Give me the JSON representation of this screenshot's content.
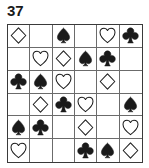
{
  "puzzle": {
    "number_label": "37",
    "grid": {
      "rows": 6,
      "columns": 6,
      "cells": [
        [
          {
            "suit": "diamond",
            "fill": "outline",
            "glyph": "♢"
          },
          {
            "suit": "empty",
            "fill": "none",
            "glyph": ""
          },
          {
            "suit": "spade",
            "fill": "filled",
            "glyph": "♠"
          },
          {
            "suit": "empty",
            "fill": "none",
            "glyph": ""
          },
          {
            "suit": "heart",
            "fill": "outline",
            "glyph": "♡"
          },
          {
            "suit": "club",
            "fill": "filled",
            "glyph": "♣"
          }
        ],
        [
          {
            "suit": "empty",
            "fill": "none",
            "glyph": ""
          },
          {
            "suit": "heart",
            "fill": "outline",
            "glyph": "♡"
          },
          {
            "suit": "diamond",
            "fill": "outline",
            "glyph": "♢"
          },
          {
            "suit": "spade",
            "fill": "filled",
            "glyph": "♠"
          },
          {
            "suit": "club",
            "fill": "filled",
            "glyph": "♣"
          },
          {
            "suit": "empty",
            "fill": "none",
            "glyph": ""
          }
        ],
        [
          {
            "suit": "club",
            "fill": "filled",
            "glyph": "♣"
          },
          {
            "suit": "spade",
            "fill": "filled",
            "glyph": "♠"
          },
          {
            "suit": "heart",
            "fill": "outline",
            "glyph": "♡"
          },
          {
            "suit": "empty",
            "fill": "none",
            "glyph": ""
          },
          {
            "suit": "diamond",
            "fill": "outline",
            "glyph": "♢"
          },
          {
            "suit": "empty",
            "fill": "none",
            "glyph": ""
          }
        ],
        [
          {
            "suit": "empty",
            "fill": "none",
            "glyph": ""
          },
          {
            "suit": "diamond",
            "fill": "outline",
            "glyph": "♢"
          },
          {
            "suit": "club",
            "fill": "filled",
            "glyph": "♣"
          },
          {
            "suit": "heart",
            "fill": "outline",
            "glyph": "♡"
          },
          {
            "suit": "empty",
            "fill": "none",
            "glyph": ""
          },
          {
            "suit": "spade",
            "fill": "filled",
            "glyph": "♠"
          }
        ],
        [
          {
            "suit": "spade",
            "fill": "filled",
            "glyph": "♠"
          },
          {
            "suit": "club",
            "fill": "filled",
            "glyph": "♣"
          },
          {
            "suit": "empty",
            "fill": "none",
            "glyph": ""
          },
          {
            "suit": "diamond",
            "fill": "outline",
            "glyph": "♢"
          },
          {
            "suit": "empty",
            "fill": "none",
            "glyph": ""
          },
          {
            "suit": "heart",
            "fill": "outline",
            "glyph": "♡"
          }
        ],
        [
          {
            "suit": "heart",
            "fill": "outline",
            "glyph": "♡"
          },
          {
            "suit": "empty",
            "fill": "none",
            "glyph": ""
          },
          {
            "suit": "empty",
            "fill": "none",
            "glyph": ""
          },
          {
            "suit": "club",
            "fill": "filled",
            "glyph": "♣"
          },
          {
            "suit": "spade",
            "fill": "filled",
            "glyph": "♠"
          },
          {
            "suit": "diamond",
            "fill": "outline",
            "glyph": "♢"
          }
        ]
      ]
    }
  },
  "colors": {
    "ink": "#1a1a1a",
    "grid_line": "#6b6b6b",
    "grid_border": "#3a3a3a",
    "background": "#ffffff"
  }
}
